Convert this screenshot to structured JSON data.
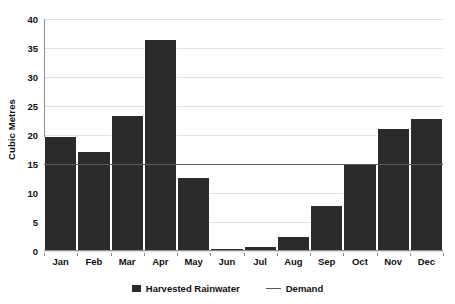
{
  "chart_data": {
    "type": "bar",
    "title": "",
    "xlabel": "",
    "ylabel": "Cubic Metres",
    "categories": [
      "Jan",
      "Feb",
      "Mar",
      "Apr",
      "May",
      "Jun",
      "Jul",
      "Aug",
      "Sep",
      "Oct",
      "Nov",
      "Dec"
    ],
    "series": [
      {
        "name": "Harvested Rainwater",
        "type": "bar",
        "color": "#2b2b2b",
        "values": [
          19.6,
          17.0,
          23.2,
          36.4,
          12.6,
          0.3,
          0.7,
          2.4,
          7.8,
          14.9,
          21.1,
          22.7
        ]
      },
      {
        "name": "Demand",
        "type": "line",
        "color": "#5a5a5a",
        "values": [
          14.9,
          14.9,
          14.9,
          14.9,
          14.9,
          14.9,
          14.9,
          14.9,
          14.9,
          14.9,
          14.9,
          14.9
        ]
      }
    ],
    "ylim": [
      0,
      40
    ],
    "ytick_values": [
      40,
      35,
      30,
      25,
      20,
      15,
      10,
      5,
      0
    ],
    "ytick_labels": [
      "40",
      "35",
      "30",
      "25",
      "20",
      "15",
      "10",
      "5",
      "0"
    ],
    "grid": true,
    "grid_axis": "y",
    "legend_position": "bottom",
    "legend": [
      {
        "label": "Harvested Rainwater",
        "marker": "bar-swatch",
        "color": "#2b2b2b"
      },
      {
        "label": "Demand",
        "marker": "line-swatch",
        "color": "#5a5a5a"
      }
    ]
  },
  "axes": {
    "y_title": "Cubic Metres"
  }
}
